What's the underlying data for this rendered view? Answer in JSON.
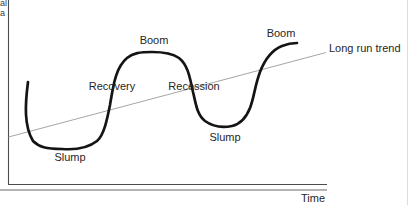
{
  "diagram": {
    "phase_labels": {
      "boom_first": "Boom",
      "boom_second": "Boom",
      "recovery": "Recovery",
      "recession": "Recession",
      "slump_first": "Slump",
      "slump_second": "Slump"
    },
    "trend_label": "Long run trend",
    "x_axis_label": "Time",
    "y_axis_label_fragments": {
      "line1": "al",
      "line2": "a"
    },
    "colors": {
      "curve": "#141414",
      "trend_line": "#9b9b9b",
      "axis": "#4d4d4d",
      "underline": "#9b9b9b",
      "page_edge": "#dcdcdc",
      "text": "#262626"
    }
  }
}
